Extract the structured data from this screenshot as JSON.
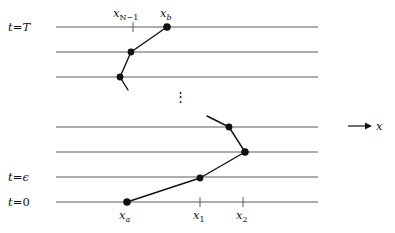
{
  "figure": {
    "kind": "lattice-path-spacetime-diagram",
    "background_color": "#ffffff",
    "line_color": "#555555",
    "path_color": "#111111",
    "dot_color": "#111111",
    "width": 395,
    "height": 233
  },
  "time_labels": [
    {
      "id": "t-T",
      "text_t": "t",
      "eq": "=",
      "value": "T",
      "x": 8,
      "y": 20,
      "line_y": 27
    },
    {
      "id": "t-epsilon",
      "text_t": "t",
      "eq": "=",
      "value": "ϵ",
      "x": 8,
      "y": 170,
      "line_y": 177
    },
    {
      "id": "t-zero",
      "text_t": "t",
      "eq": "=",
      "value": "0",
      "x": 8,
      "y": 195,
      "line_y": 202
    }
  ],
  "time_lines": [
    {
      "id": "line-t-T",
      "y": 27,
      "x1": 56,
      "x2": 318,
      "labeled": "t = T"
    },
    {
      "id": "line-t-T-minus-1",
      "y": 52,
      "x1": 56,
      "x2": 318,
      "labeled": ""
    },
    {
      "id": "line-t-T-minus-2",
      "y": 77,
      "x1": 56,
      "x2": 318,
      "labeled": ""
    },
    {
      "id": "line-mid-upper",
      "y": 127,
      "x1": 56,
      "x2": 318,
      "labeled": ""
    },
    {
      "id": "line-mid-lower",
      "y": 152,
      "x1": 56,
      "x2": 318,
      "labeled": ""
    },
    {
      "id": "line-t-epsilon",
      "y": 177,
      "x1": 56,
      "x2": 318,
      "labeled": "t = ϵ"
    },
    {
      "id": "line-t-zero",
      "y": 202,
      "x1": 56,
      "x2": 318,
      "labeled": "t = 0"
    }
  ],
  "position_labels": [
    {
      "id": "x-N-minus-1",
      "base": "x",
      "sub": "N−1",
      "sub_upright": true,
      "x": 113,
      "y": 6,
      "tick_x": 133,
      "tick_y": 27
    },
    {
      "id": "x-b",
      "base": "x",
      "sub": "b",
      "sub_upright": false,
      "x": 160,
      "y": 6,
      "tick_x": null,
      "tick_y": 27
    },
    {
      "id": "x-a",
      "base": "x",
      "sub": "a",
      "sub_upright": false,
      "x": 119,
      "y": 208,
      "tick_x": null,
      "tick_y": 202
    },
    {
      "id": "x-1",
      "base": "x",
      "sub": "1",
      "sub_upright": true,
      "x": 193,
      "y": 208,
      "tick_x": 200,
      "tick_y": 202
    },
    {
      "id": "x-2",
      "base": "x",
      "sub": "2",
      "sub_upright": true,
      "x": 236,
      "y": 208,
      "tick_x": 243,
      "tick_y": 202
    }
  ],
  "ticks": [
    {
      "id": "tick-x-N-minus-1",
      "x": 133,
      "y_center": 27,
      "half_len": 5
    },
    {
      "id": "tick-x-1",
      "x": 200,
      "y_center": 202,
      "half_len": 5
    },
    {
      "id": "tick-x-2",
      "x": 243,
      "y_center": 202,
      "half_len": 5
    }
  ],
  "path_upper": {
    "id": "upper-path-segment",
    "description": "partial zigzag worldline arriving at x_b on t = T",
    "points": [
      {
        "x": 128,
        "y": 90,
        "dot": false
      },
      {
        "x": 120,
        "y": 77,
        "dot": true
      },
      {
        "x": 131,
        "y": 52,
        "dot": true
      },
      {
        "x": 167,
        "y": 27,
        "dot": true
      }
    ]
  },
  "path_lower": {
    "id": "lower-path-segment",
    "description": "zigzag worldline leaving x_a on t = 0",
    "points": [
      {
        "x": 127,
        "y": 202,
        "dot": true
      },
      {
        "x": 200,
        "y": 178,
        "dot": true
      },
      {
        "x": 245,
        "y": 152,
        "dot": true
      },
      {
        "x": 229,
        "y": 127,
        "dot": true
      },
      {
        "x": 207,
        "y": 116,
        "dot": false
      }
    ]
  },
  "vertical_dots": {
    "id": "vertical-ellipsis",
    "glyph": "⋮",
    "x": 174,
    "y": 90
  },
  "x_axis_arrow": {
    "id": "x-axis-arrow",
    "label": "x",
    "line_x1": 348,
    "line_x2": 369,
    "y": 126,
    "label_x": 376,
    "label_y": 119
  }
}
